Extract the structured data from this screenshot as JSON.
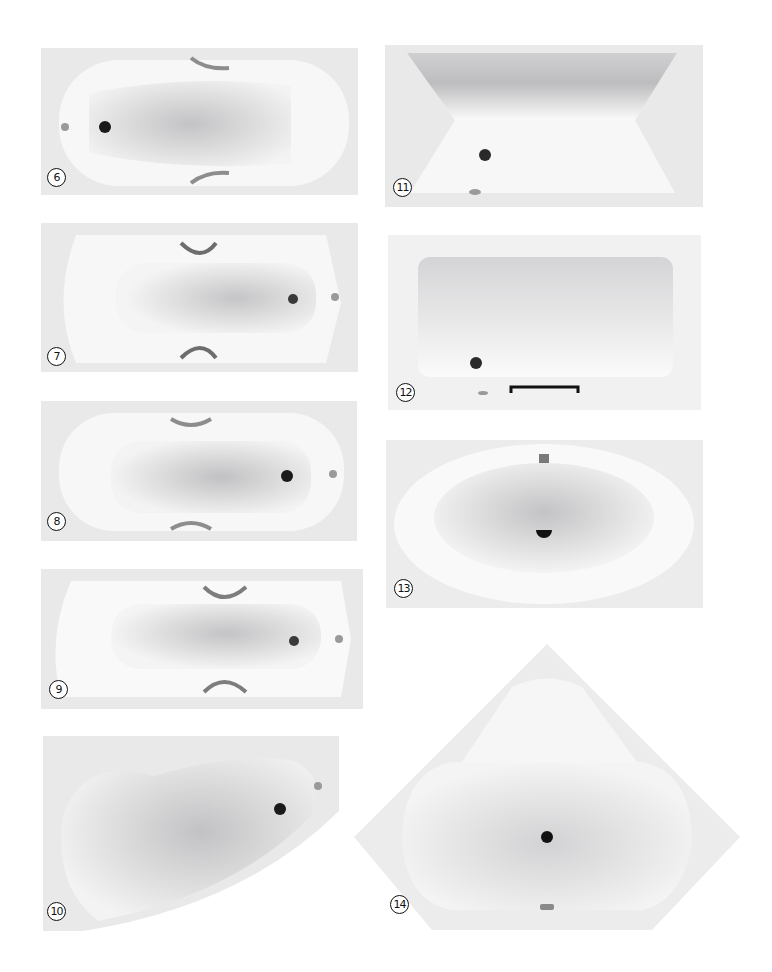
{
  "catalog": {
    "items": [
      {
        "id": "6",
        "label": "6",
        "type": "rectangular bathtub with handles"
      },
      {
        "id": "7",
        "label": "7",
        "type": "rectangular bathtub with handles"
      },
      {
        "id": "8",
        "label": "8",
        "type": "rectangular bathtub with handles"
      },
      {
        "id": "9",
        "label": "9",
        "type": "rectangular bathtub with handles"
      },
      {
        "id": "10",
        "label": "10",
        "type": "asymmetric corner bathtub"
      },
      {
        "id": "11",
        "label": "11",
        "type": "rectangular bathtub"
      },
      {
        "id": "12",
        "label": "12",
        "type": "rectangular bathtub with grip bar"
      },
      {
        "id": "13",
        "label": "13",
        "type": "oval bathtub"
      },
      {
        "id": "14",
        "label": "14",
        "type": "pentagonal corner bathtub"
      }
    ]
  },
  "colors": {
    "rim": "#e9e9ea",
    "basin": "#c9c9cb",
    "drain": "#1a1a1a",
    "chrome": "#9a9a9a"
  }
}
